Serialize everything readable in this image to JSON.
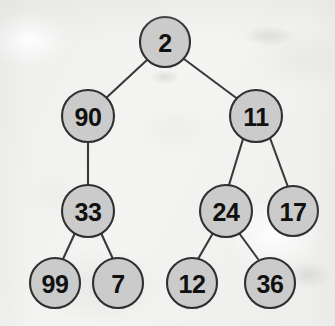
{
  "figure": {
    "kind": "binary-tree-diagram",
    "width": 335,
    "height": 326,
    "background_color": "#f2f2f1",
    "node_fill_color": "#cbcbcb",
    "node_stroke_color": "#2f2f2f",
    "edge_color": "#3a3a3a",
    "label_color": "#111111"
  },
  "tree": {
    "root_id": "n-2",
    "nodes": [
      {
        "id": "n-2",
        "label": "2",
        "cx": 165,
        "cy": 42,
        "r": 25,
        "level": 0
      },
      {
        "id": "n-90",
        "label": "90",
        "cx": 88,
        "cy": 116,
        "r": 26,
        "level": 1
      },
      {
        "id": "n-11",
        "label": "11",
        "cx": 256,
        "cy": 116,
        "r": 26,
        "level": 1
      },
      {
        "id": "n-33",
        "label": "33",
        "cx": 88,
        "cy": 211,
        "r": 26,
        "level": 2
      },
      {
        "id": "n-24",
        "label": "24",
        "cx": 226,
        "cy": 211,
        "r": 26,
        "level": 2
      },
      {
        "id": "n-17",
        "label": "17",
        "cx": 293,
        "cy": 211,
        "r": 25,
        "level": 2
      },
      {
        "id": "n-99",
        "label": "99",
        "cx": 55,
        "cy": 283,
        "r": 25,
        "level": 3
      },
      {
        "id": "n-7",
        "label": "7",
        "cx": 118,
        "cy": 283,
        "r": 25,
        "level": 3
      },
      {
        "id": "n-12",
        "label": "12",
        "cx": 192,
        "cy": 283,
        "r": 25,
        "level": 3
      },
      {
        "id": "n-36",
        "label": "36",
        "cx": 270,
        "cy": 283,
        "r": 25,
        "level": 3
      }
    ],
    "edges": [
      {
        "id": "e-2-90",
        "from": "n-2",
        "to": "n-90",
        "x1": 147,
        "y1": 60,
        "x2": 105,
        "y2": 99
      },
      {
        "id": "e-2-11",
        "from": "n-2",
        "to": "n-11",
        "x1": 184,
        "y1": 59,
        "x2": 239,
        "y2": 100
      },
      {
        "id": "e-90-33",
        "from": "n-90",
        "to": "n-33",
        "x1": 88,
        "y1": 142,
        "x2": 88,
        "y2": 185
      },
      {
        "id": "e-11-24",
        "from": "n-11",
        "to": "n-24",
        "x1": 243,
        "y1": 139,
        "x2": 229,
        "y2": 185
      },
      {
        "id": "e-11-17",
        "from": "n-11",
        "to": "n-17",
        "x1": 270,
        "y1": 138,
        "x2": 288,
        "y2": 187
      },
      {
        "id": "e-33-99",
        "from": "n-33",
        "to": "n-99",
        "x1": 75,
        "y1": 233,
        "x2": 63,
        "y2": 259
      },
      {
        "id": "e-33-7",
        "from": "n-33",
        "to": "n-7",
        "x1": 101,
        "y1": 233,
        "x2": 113,
        "y2": 259
      },
      {
        "id": "e-24-12",
        "from": "n-24",
        "to": "n-12",
        "x1": 213,
        "y1": 233,
        "x2": 198,
        "y2": 259
      },
      {
        "id": "e-24-36",
        "from": "n-24",
        "to": "n-36",
        "x1": 239,
        "y1": 233,
        "x2": 258,
        "y2": 259
      }
    ]
  },
  "artifacts": {
    "smudges": [
      {
        "id": "smudge-top-right",
        "left": 243,
        "top": 26,
        "width": 52,
        "height": 20
      },
      {
        "id": "smudge-mid-right",
        "left": 286,
        "top": 262,
        "width": 46,
        "height": 26
      },
      {
        "id": "smudge-center",
        "left": 150,
        "top": 70,
        "width": 30,
        "height": 14
      }
    ]
  }
}
